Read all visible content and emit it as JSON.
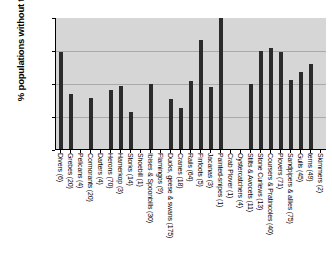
{
  "chart_data": {
    "type": "bar",
    "title": "",
    "xlabel": "",
    "ylabel": "% populations without trend",
    "ylim": [
      0,
      100
    ],
    "yticks": [
      0,
      25,
      50,
      75,
      100
    ],
    "grid": true,
    "legend": "none",
    "categories": [
      "Divers (6)",
      "Grebes (20)",
      "Pelicans (4)",
      "Cormorants (20)",
      "Darters (4)",
      "Herons (70)",
      "Hamerkop (3)",
      "Storks (14)",
      "Shoebill (1)",
      "Ibises & Spoonbills (30)",
      "Flamingos (9)",
      "Ducks, geese & swans (175)",
      "Cranes (18)",
      "Rails (64)",
      "Finfoots (5)",
      "Jacanas (3)",
      "Painted-snipes (1)",
      "Crab Plover (1)",
      "Oystercatchers (4)",
      "Stilts & Avocets (11)",
      "Stone Curlews (13)",
      "Coursers & Pratincoles (40)",
      "Plovers (71)",
      "Sandpipers & allies (75)",
      "Gulls (45)",
      "terns (49)",
      "Skimmers (2)"
    ],
    "values": [
      74,
      42,
      0,
      39,
      0,
      45,
      48,
      28,
      0,
      50,
      0,
      38,
      31,
      52,
      83,
      47,
      100,
      0,
      0,
      50,
      75,
      77,
      74,
      53,
      59,
      65,
      0
    ]
  }
}
